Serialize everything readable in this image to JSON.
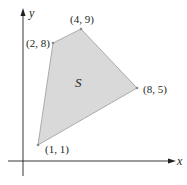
{
  "diagram": {
    "axes": {
      "x_label": "x",
      "y_label": "y"
    },
    "region": {
      "label": "S",
      "fill": "#d9d9d9",
      "stroke": "#9a9a9a"
    },
    "vertices": [
      {
        "x": 1,
        "y": 1,
        "label": "(1, 1)"
      },
      {
        "x": 2,
        "y": 8,
        "label": "(2, 8)"
      },
      {
        "x": 4,
        "y": 9,
        "label": "(4, 9)"
      },
      {
        "x": 8,
        "y": 5,
        "label": "(8, 5)"
      }
    ],
    "colors": {
      "axis": "#231f20",
      "text": "#231f20"
    }
  }
}
